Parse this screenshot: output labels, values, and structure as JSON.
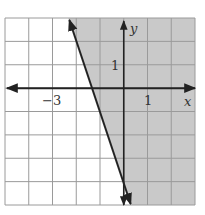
{
  "chart_data": {
    "type": "inequality-graph",
    "title": "",
    "boundary_line": {
      "equation": "y = -3x - 4",
      "slope": -3,
      "intercept": -4,
      "style": "solid"
    },
    "inequality": "y >= -3x - 4",
    "shaded_side": "right",
    "x_range": [
      -5,
      3
    ],
    "y_range": [
      -5,
      3
    ],
    "grid": true,
    "grid_step": 1,
    "x_axis_label": "x",
    "y_axis_label": "y",
    "tick_labels": {
      "x": [
        {
          "value": -3,
          "text": "−3"
        },
        {
          "value": 1,
          "text": "1"
        }
      ],
      "y": [
        {
          "value": 1,
          "text": "1"
        }
      ]
    }
  },
  "colors": {
    "shade": "#c9c9c9",
    "grid": "#9a9a9a",
    "axis": "#222222",
    "line": "#222222",
    "background": "#ffffff"
  },
  "labels": {
    "x_axis": "x",
    "y_axis": "y",
    "tick_neg3": "−3",
    "tick_x1": "1",
    "tick_y1": "1"
  }
}
